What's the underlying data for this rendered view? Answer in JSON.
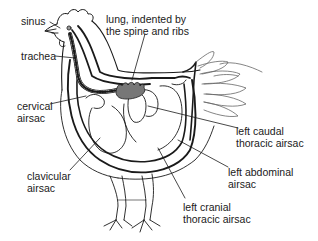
{
  "figure": {
    "colors": {
      "line": "#1a1a1a",
      "lung_fill": "#777777",
      "feather_line": "#666666",
      "background": "#ffffff"
    }
  },
  "labels": {
    "sinus": "sinus",
    "lung": "lung, indented by\nthe spine and ribs",
    "trachea": "trachea",
    "cervical_airsac": "cervical\nairsac",
    "clavicular_airsac": "clavicular\nairsac",
    "left_caudal_thoracic_airsac": "left caudal\nthoracic airsac",
    "left_abdominal_airsac": "left abdominal\nairsac",
    "left_cranial_thoracic_airsac": "left cranial\nthoracic airsac"
  }
}
